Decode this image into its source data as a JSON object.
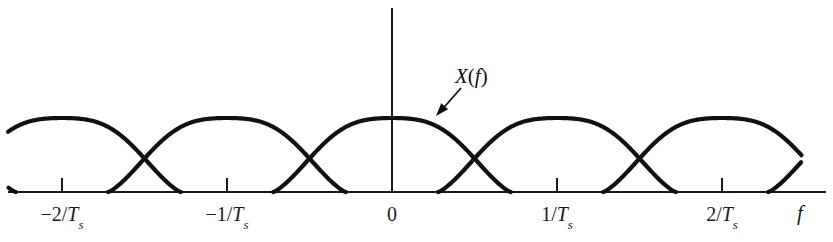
{
  "figure": {
    "title_visible": false,
    "background_color": "#ffffff",
    "ink_color": "#111111"
  },
  "axis": {
    "variable_label": "f",
    "origin_label": "0",
    "baseline_y": 192,
    "vertical_axis_x": 392,
    "vertical_axis_top": 8,
    "ticks": [
      {
        "label_plain": "-2/Ts",
        "minus": "−",
        "num": "2",
        "slash": "/",
        "T": "T",
        "sub": "s",
        "x": 62
      },
      {
        "label_plain": "-1/Ts",
        "minus": "−",
        "num": "1",
        "slash": "/",
        "T": "T",
        "sub": "s",
        "x": 227
      },
      {
        "label_plain": "0",
        "x": 392
      },
      {
        "label_plain": "1/Ts",
        "minus": "",
        "num": "1",
        "slash": "/",
        "T": "T",
        "sub": "s",
        "x": 557
      },
      {
        "label_plain": "2/Ts",
        "minus": "",
        "num": "2",
        "slash": "/",
        "T": "T",
        "sub": "s",
        "x": 722
      }
    ]
  },
  "annotation": {
    "label_X": "X",
    "label_paren_open": "(",
    "label_f": "f",
    "label_paren_close": ")",
    "label_full": "X(f)",
    "label_x": 455,
    "label_y": 66,
    "arrow_tail_x": 461,
    "arrow_tail_y": 88,
    "arrow_tip_x": 436,
    "arrow_tip_y": 116
  },
  "chart_data": {
    "type": "line",
    "title": "",
    "xlabel": "f",
    "ylabel": "",
    "grid": false,
    "legend": null,
    "axis_ranges": {
      "x_units": [
        -2.55,
        2.55
      ],
      "y_units": [
        0,
        1
      ]
    },
    "period_units": 1,
    "replica_centers_units": [
      -3,
      -2,
      -1,
      0,
      1,
      2,
      3
    ],
    "pulse": {
      "shape": "raised-cosine-like bell",
      "peak_value": 1.0,
      "half_width_units": 0.72,
      "shoulder_ripple": 0.12
    },
    "annotations": [
      {
        "text": "X(f)",
        "points_to_units": [
          0.27,
          0.92
        ]
      }
    ],
    "tick_values_units": [
      -2,
      -1,
      0,
      1,
      2
    ],
    "tick_labels": [
      "-2/Ts",
      "-1/Ts",
      "0",
      "1/Ts",
      "2/Ts"
    ],
    "sampled_envelope": {
      "note": "Visual envelope of summed replicas: peaks near half-integer offsets, dips at integer multiples of 1/Ts",
      "peak_pixel_y": 118,
      "dip_pixel_y": 140,
      "baseline_pixel_y": 192
    }
  }
}
